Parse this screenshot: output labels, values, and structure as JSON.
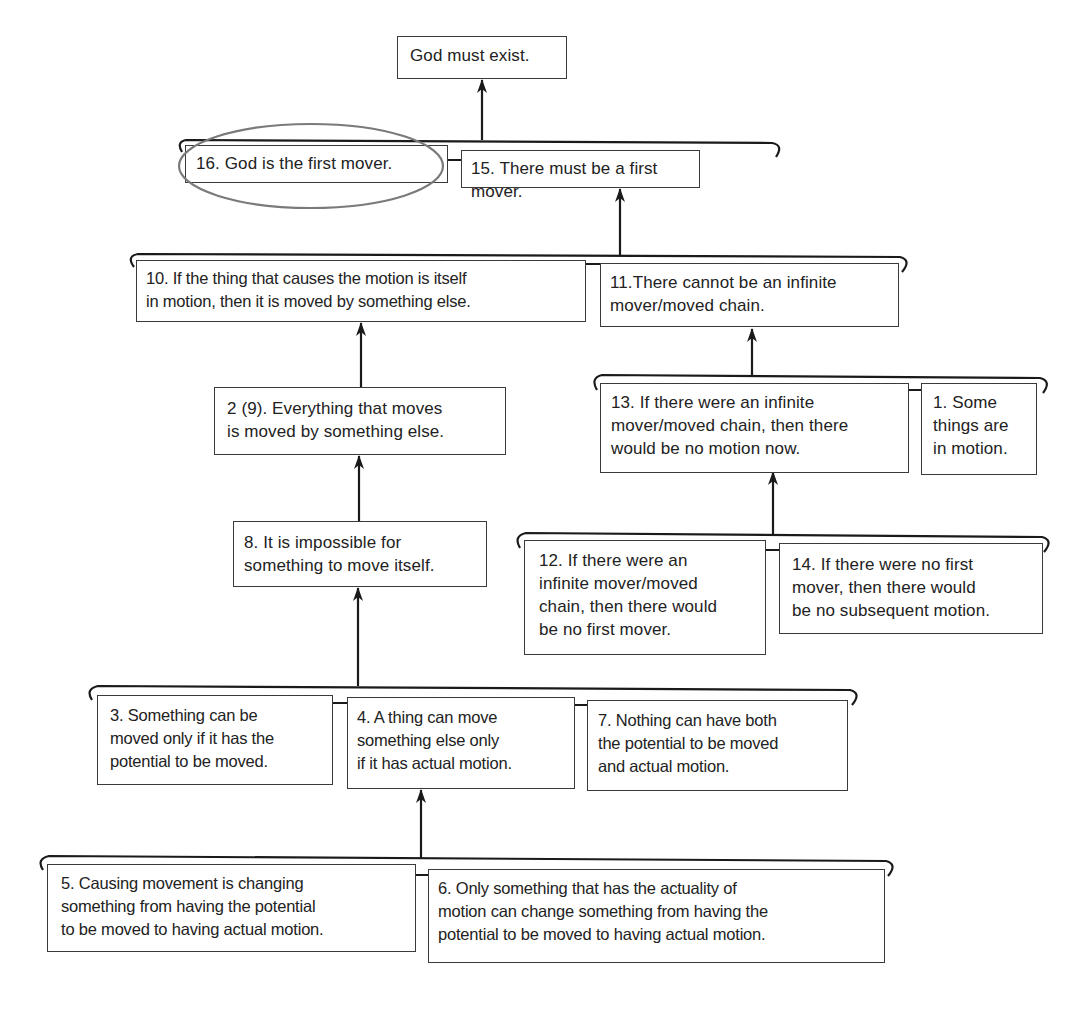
{
  "diagram": {
    "conclusion": "God must exist.",
    "nodes": {
      "n16": "16. God is the first mover.",
      "n15": "15. There must be a first mover.",
      "n10": "10. If the thing that causes the motion is itself\nin motion, then it is moved by something else.",
      "n11": "11.There cannot be an infinite\nmover/moved chain.",
      "n2": "2 (9). Everything that moves\nis moved by something else.",
      "n13": "13. If there were an infinite\nmover/moved chain, then there\nwould be no motion now.",
      "n1": "1. Some\nthings are\nin motion.",
      "n8": "8. It is impossible for\nsomething to move itself.",
      "n12": "12. If there were an\ninfinite mover/moved\nchain, then there would\nbe no first mover.",
      "n14": "14. If there were no first\nmover, then there would\nbe no subsequent motion.",
      "n3": "3. Something can be\nmoved only if it has the\npotential to be moved.",
      "n4": "4. A thing can move\nsomething else only\nif it has actual motion.",
      "n7": "7. Nothing can have both\nthe potential to be moved\nand actual motion.",
      "n5": "5. Causing movement is changing\nsomething from having the potential\nto be moved to having actual motion.",
      "n6": "6. Only something that has the actuality of\nmotion can change something from having the\npotential to be moved to having actual motion."
    },
    "highlight": {
      "node": "n16",
      "shape": "ellipse",
      "color": "#7a7a7a"
    },
    "links": [
      {
        "from": [
          "n16",
          "n15"
        ],
        "to": "conclusion"
      },
      {
        "from": [
          "n10",
          "n11"
        ],
        "to": "n15"
      },
      {
        "from": [
          "n2"
        ],
        "to": "n10"
      },
      {
        "from": [
          "n13",
          "n1"
        ],
        "to": "n11"
      },
      {
        "from": [
          "n8"
        ],
        "to": "n2"
      },
      {
        "from": [
          "n12",
          "n14"
        ],
        "to": "n13"
      },
      {
        "from": [
          "n3",
          "n4",
          "n7"
        ],
        "to": "n8"
      },
      {
        "from": [
          "n5",
          "n6"
        ],
        "to": "n4"
      }
    ],
    "colors": {
      "line": "#1a1a1a",
      "box_border": "#3a3a3a",
      "text": "#222222",
      "background": "#ffffff"
    }
  }
}
